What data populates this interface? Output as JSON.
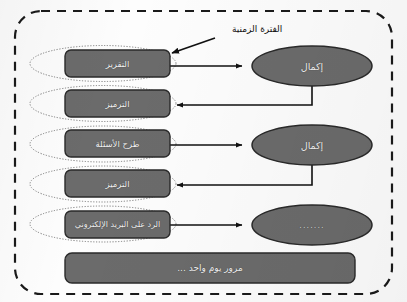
{
  "diagram": {
    "title_annotation": "الفترة الزمنية",
    "annotation_name": "time-period-callout",
    "outer_frame": {
      "style": "dashed-rounded-rectangle",
      "stroke_color": "#1a1a1a"
    },
    "palette": {
      "node_fill": "#6b6b6b",
      "node_stroke": "#2a2a2a",
      "node_text": "#f2f2f2",
      "connector": "#111111",
      "halo_stroke": "#6f6f6f",
      "frame_stroke": "#1a1a1a",
      "background": "#fdfdfd"
    },
    "tasks": [
      {
        "id": "task-report",
        "label": "التقرير"
      },
      {
        "id": "task-coding-1",
        "label": "الترميز"
      },
      {
        "id": "task-questions",
        "label": "طرح الأسئلة"
      },
      {
        "id": "task-coding-2",
        "label": "الترميز"
      },
      {
        "id": "task-email",
        "label": "الرد على البريد الإلكتروني"
      }
    ],
    "states": [
      {
        "id": "state-completion-1",
        "label": "إكمال"
      },
      {
        "id": "state-completion-2",
        "label": "إكمال"
      },
      {
        "id": "state-pending",
        "label": "......."
      }
    ],
    "time_bar": {
      "id": "time-bar",
      "label": "مرور يوم واحد ..."
    },
    "connectors": [
      {
        "from": "task-report",
        "to": "state-completion-1",
        "direction": "right"
      },
      {
        "from": "state-completion-1",
        "to": "task-coding-1",
        "direction": "left"
      },
      {
        "from": "task-questions",
        "to": "state-completion-2",
        "direction": "right"
      },
      {
        "from": "state-completion-2",
        "to": "task-coding-2",
        "direction": "left"
      },
      {
        "from": "task-email",
        "to": "state-pending",
        "direction": "right"
      }
    ]
  }
}
